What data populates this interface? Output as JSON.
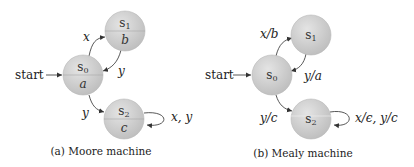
{
  "diagrams": [
    {
      "caption": "(a) Moore machine",
      "start_label": "start",
      "states": [
        {
          "name": "s0",
          "sub": "0",
          "base": "s",
          "output": "a"
        },
        {
          "name": "s1",
          "sub": "1",
          "base": "s",
          "output": "b"
        },
        {
          "name": "s2",
          "sub": "2",
          "base": "s",
          "output": "c"
        }
      ],
      "edges": [
        {
          "from": "s0",
          "to": "s1",
          "label": "x"
        },
        {
          "from": "s1",
          "to": "s0",
          "label": "y"
        },
        {
          "from": "s0",
          "to": "s2",
          "label": "y"
        },
        {
          "from": "s2",
          "to": "s2",
          "label": "x, y"
        }
      ]
    },
    {
      "caption": "(b) Mealy machine",
      "start_label": "start",
      "states": [
        {
          "name": "s0",
          "sub": "0",
          "base": "s"
        },
        {
          "name": "s1",
          "sub": "1",
          "base": "s"
        },
        {
          "name": "s2",
          "sub": "2",
          "base": "s"
        }
      ],
      "edges": [
        {
          "from": "s0",
          "to": "s1",
          "label": "x/b"
        },
        {
          "from": "s1",
          "to": "s0",
          "label": "y/a"
        },
        {
          "from": "s0",
          "to": "s2",
          "label": "y/c"
        },
        {
          "from": "s2",
          "to": "s2",
          "label": "x/ϵ, y/c"
        }
      ]
    }
  ],
  "colors": {
    "state_fill": "#c9c9c9",
    "state_stroke": "#b0b0b0",
    "edge": "#444444",
    "text": "#222222"
  }
}
